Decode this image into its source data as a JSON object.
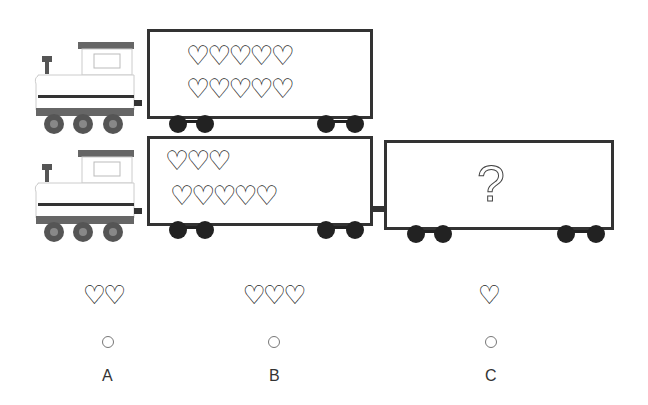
{
  "puzzle": {
    "row1": {
      "car_hearts_row1": "♡♡♡♡♡",
      "car_hearts_row2": "♡♡♡♡♡"
    },
    "row2": {
      "car_hearts_row1": "♡♡♡",
      "car_hearts_row2": "♡♡♡♡♡",
      "mystery": "?"
    }
  },
  "options": [
    {
      "hearts": "♡♡",
      "label": "A"
    },
    {
      "hearts": "♡♡♡",
      "label": "B"
    },
    {
      "hearts": "♡",
      "label": "C"
    }
  ]
}
